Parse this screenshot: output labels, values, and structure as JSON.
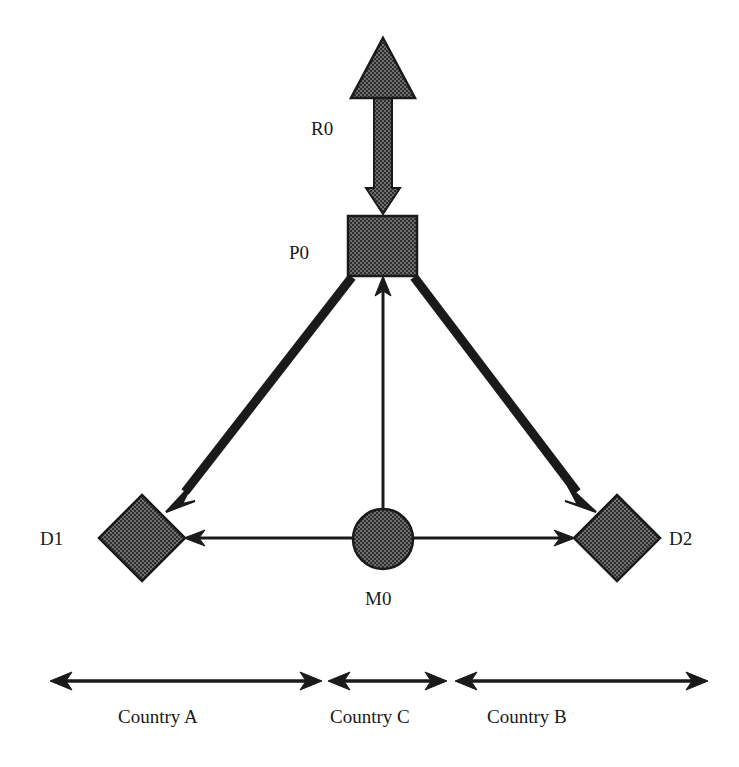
{
  "diagram": {
    "background_color": "#ffffff",
    "shape_fill_color": "#555555",
    "stroke_color": "#1a1a1a",
    "nodes": [
      {
        "id": "R0",
        "label": "R0",
        "shape": "triangle",
        "label_x": 311,
        "label_y": 119,
        "cx": 383,
        "cy": 68,
        "half_width": 32,
        "height": 60
      },
      {
        "id": "P0",
        "label": "P0",
        "shape": "square",
        "label_x": 289,
        "label_y": 243,
        "x": 348,
        "y": 216,
        "width": 69,
        "height": 60
      },
      {
        "id": "D1",
        "label": "D1",
        "shape": "diamond",
        "label_x": 40,
        "label_y": 529,
        "cx": 142,
        "cy": 538,
        "radius": 43
      },
      {
        "id": "D2",
        "label": "D2",
        "shape": "diamond",
        "label_x": 669,
        "label_y": 529,
        "cx": 617,
        "cy": 538,
        "radius": 43
      },
      {
        "id": "M0",
        "label": "M0",
        "shape": "circle",
        "label_x": 365,
        "label_y": 589,
        "cx": 383,
        "cy": 539,
        "radius": 30
      }
    ],
    "edges": [
      {
        "id": "R0-P0",
        "from": "R0",
        "to": "P0",
        "weight": "thick-hatched",
        "direction": "down",
        "x1": 383,
        "y1": 98,
        "x2": 383,
        "y2": 214
      },
      {
        "id": "P0-D1",
        "from": "P0",
        "to": "D1",
        "weight": "thick",
        "direction": "down-left",
        "x1": 352,
        "y1": 277,
        "x2": 171,
        "y2": 508
      },
      {
        "id": "P0-D2",
        "from": "P0",
        "to": "D2",
        "weight": "thick",
        "direction": "down-right",
        "x1": 414,
        "y1": 277,
        "x2": 590,
        "y2": 508
      },
      {
        "id": "M0-P0",
        "from": "M0",
        "to": "P0",
        "weight": "thin",
        "direction": "up",
        "x1": 383,
        "y1": 509,
        "x2": 383,
        "y2": 279
      },
      {
        "id": "M0-D1",
        "from": "M0",
        "to": "D1",
        "weight": "thin",
        "direction": "left",
        "x1": 353,
        "y1": 538,
        "x2": 187,
        "y2": 538
      },
      {
        "id": "M0-D2",
        "from": "M0",
        "to": "D2",
        "weight": "thin",
        "direction": "right",
        "x1": 413,
        "y1": 538,
        "x2": 572,
        "y2": 538
      }
    ],
    "sections": [
      {
        "id": "country-a",
        "label": "Country A",
        "label_x": 118,
        "label_y": 707,
        "span_x1": 52,
        "span_x2": 320,
        "span_y": 681
      },
      {
        "id": "country-c",
        "label": "Country C",
        "label_x": 330,
        "label_y": 707,
        "span_x1": 330,
        "span_x2": 445,
        "span_y": 681
      },
      {
        "id": "country-b",
        "label": "Country B",
        "label_x": 487,
        "label_y": 707,
        "span_x1": 457,
        "span_x2": 706,
        "span_y": 681
      }
    ]
  }
}
